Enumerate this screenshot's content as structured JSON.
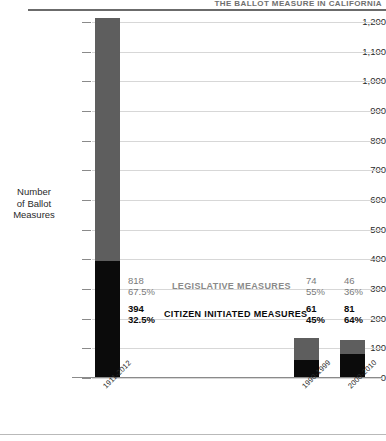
{
  "figure": {
    "title_fragment": "THE BALLOT MEASURE IN CALIFORNIA",
    "y_axis_title_line1": "Number",
    "y_axis_title_line2": "of Ballot",
    "y_axis_title_line3": "Measures"
  },
  "chart_data": {
    "type": "bar",
    "stacked": true,
    "title": "THE BALLOT MEASURE IN CALIFORNIA",
    "xlabel": "",
    "ylabel": "Number of Ballot Measures",
    "ylim": [
      0,
      1200
    ],
    "yticks": [
      0,
      100,
      200,
      300,
      400,
      500,
      600,
      700,
      800,
      900,
      1000,
      1100,
      1200
    ],
    "ytick_labels": [
      "0",
      "100",
      "200",
      "300",
      "400",
      "500",
      "600",
      "700",
      "800",
      "900",
      "1,000",
      "1,100",
      "1,200"
    ],
    "grid": true,
    "legend": "inline-annotations",
    "categories": [
      "1911-2012",
      "1990-1999",
      "2000-2010"
    ],
    "series": [
      {
        "name": "CITIZEN INITIATED MEASURES",
        "color": "#0b0b0b",
        "values": [
          394,
          61,
          81
        ],
        "percents": [
          "32.5%",
          "45%",
          "64%"
        ]
      },
      {
        "name": "LEGISLATIVE MEASURES",
        "color": "#5e5e5e",
        "values": [
          818,
          74,
          46
        ],
        "percents": [
          "67.5%",
          "55%",
          "36%"
        ]
      }
    ],
    "totals": [
      1212,
      135,
      127
    ],
    "annotations": [
      {
        "group": "1911-2012",
        "legislative_value": "818",
        "legislative_percent": "67.5%",
        "citizen_value": "394",
        "citizen_percent": "32.5%"
      },
      {
        "group": "1990-1999",
        "legislative_value": "74",
        "legislative_percent": "55%",
        "citizen_value": "61",
        "citizen_percent": "45%"
      },
      {
        "group": "2000-2010",
        "legislative_value": "46",
        "legislative_percent": "36%",
        "citizen_value": "81",
        "citizen_percent": "64%"
      }
    ],
    "series_labels": {
      "legislative": "LEGISLATIVE MEASURES",
      "citizen": "CITIZEN INITIATED MEASURES"
    },
    "colors": {
      "legislative": "#5e5e5e",
      "citizen": "#0b0b0b",
      "grid": "#d7d7d7",
      "axis": "#8a8a8a",
      "rule": "#6b6b6b"
    }
  }
}
